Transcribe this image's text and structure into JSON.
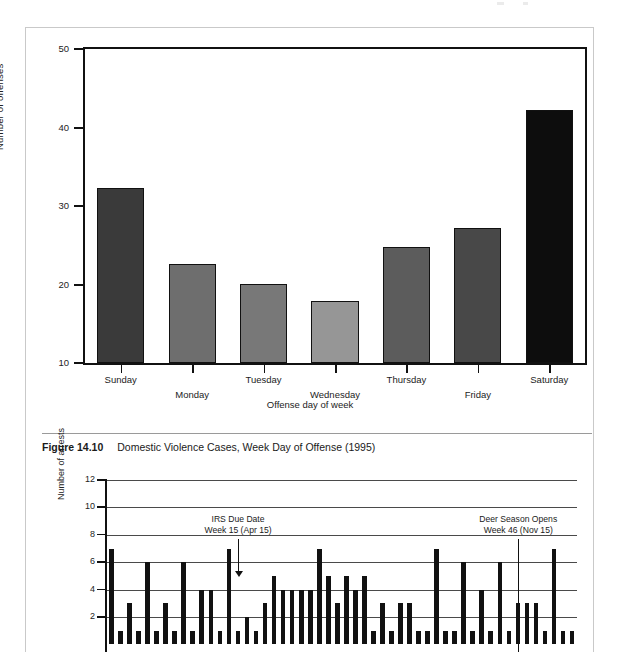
{
  "page": {
    "caption": {
      "figure_number": "Figure 14.10",
      "text": "Domestic Violence Cases, Week Day of Offense (1995)"
    }
  },
  "chart_data": [
    {
      "type": "bar",
      "id": "domestic-violence-by-weekday",
      "title": "",
      "xlabel": "Offense day of week",
      "ylabel": "Number of offenses",
      "categories": [
        "Sunday",
        "Monday",
        "Tuesday",
        "Wednesday",
        "Thursday",
        "Friday",
        "Saturday"
      ],
      "values": [
        32.3,
        22.6,
        20.1,
        17.9,
        24.8,
        27.2,
        42.2
      ],
      "colors": [
        "#3a3a3a",
        "#6e6e6e",
        "#787878",
        "#969696",
        "#5c5c5c",
        "#484848",
        "#0d0d0d"
      ],
      "ylim": [
        10,
        50
      ],
      "yticks": [
        10,
        20,
        30,
        40,
        50
      ],
      "ytick_labels": [
        "10",
        "20",
        "30",
        "40",
        "50"
      ],
      "grid": false,
      "legend": "none"
    },
    {
      "type": "bar",
      "id": "arrests-by-week",
      "title": "",
      "xlabel": "",
      "ylabel": "Number of arrests",
      "ylim": [
        0,
        12
      ],
      "yticks": [
        2,
        4,
        6,
        8,
        10,
        12
      ],
      "ytick_labels": [
        "2",
        "4",
        "6",
        "8",
        "10",
        "12"
      ],
      "grid": true,
      "legend": "none",
      "x": [
        1,
        2,
        3,
        4,
        5,
        6,
        7,
        8,
        9,
        10,
        11,
        12,
        13,
        14,
        15,
        16,
        17,
        18,
        19,
        20,
        21,
        22,
        23,
        24,
        25,
        26,
        27,
        28,
        29,
        30,
        31,
        32,
        33,
        34,
        35,
        36,
        37,
        38,
        39,
        40,
        41,
        42,
        43,
        44,
        45,
        46,
        47,
        48,
        49,
        50,
        51,
        52
      ],
      "values": [
        7,
        1,
        3,
        1,
        6,
        1,
        3,
        1,
        6,
        1,
        4,
        4,
        1,
        7,
        1,
        2,
        1,
        3,
        5,
        4,
        4,
        4,
        4,
        7,
        5,
        3,
        5,
        4,
        5,
        1,
        3,
        1,
        3,
        3,
        1,
        1,
        7,
        1,
        1,
        6,
        1,
        4,
        1,
        6,
        1,
        3,
        3,
        3,
        1,
        7,
        1,
        1
      ],
      "annotations": [
        {
          "name": "irs-due-date",
          "line1": "IRS Due Date",
          "line2": "Week 15 (Apr 15)",
          "week": 15,
          "arrow": true
        },
        {
          "name": "deer-season-opens",
          "line1": "Deer Season Opens",
          "line2": "Week 46 (Nov 15)",
          "week": 46,
          "arrow": false
        }
      ]
    }
  ]
}
